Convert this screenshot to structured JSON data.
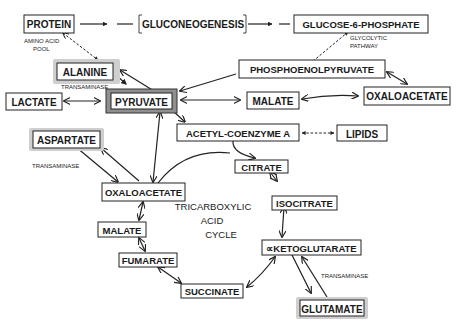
{
  "diagram": {
    "nodes": {
      "protein": "PROTEIN",
      "gluconeogenesis": "GLUCONEOGENESIS",
      "glucose6p": "GLUCOSE-6-PHOSPHATE",
      "alanine": "ALANINE",
      "pep": "PHOSPHOENOLPYRUVATE",
      "lactate": "LACTATE",
      "pyruvate": "PYRUVATE",
      "malate_top": "MALATE",
      "oaa_top": "OXALOACETATE",
      "acetylcoa": "ACETYL-COENZYME A",
      "lipids": "LIPIDS",
      "aspartate": "ASPARTATE",
      "citrate": "CITRATE",
      "oaa_cycle": "OXALOACETATE",
      "isocitrate": "ISOCITRATE",
      "malate_cycle": "MALATE",
      "akg": "∝KETOGLUTARATE",
      "fumarate": "FUMARATE",
      "succinate": "SUCCINATE",
      "glutamate": "GLUTAMATE"
    },
    "notes": {
      "amino_acid_pool_1": "AMINO ACID",
      "amino_acid_pool_2": "POOL",
      "transaminase_alanine": "TRANSAMINASE",
      "transaminase_aspartate": "TRANSAMINASE",
      "transaminase_glutamate": "TRANSAMINASE",
      "glycolytic_1": "GLYCOLYTIC",
      "glycolytic_2": "PATHWAY"
    },
    "cycle_label": {
      "line1": "TRICARBOXYLIC",
      "line2": "ACID",
      "line3": "CYCLE"
    },
    "highlighted_nodes": [
      "ALANINE",
      "PYRUVATE",
      "ASPARTATE",
      "GLUTAMATE"
    ],
    "colors": {
      "ink": "#222222",
      "halo": "#cfcfcf",
      "pyruvate_frame": "#8f8f8f",
      "background": "#ffffff"
    }
  }
}
